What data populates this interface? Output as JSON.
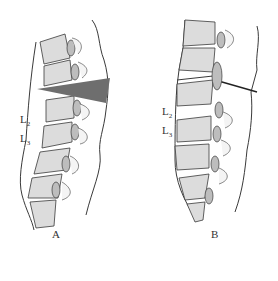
{
  "figure": {
    "panels": [
      {
        "id": "A",
        "caption": "A",
        "labels": [
          {
            "main": "L",
            "sub": "2"
          },
          {
            "main": "L",
            "sub": "3"
          }
        ],
        "wedge_color": "#6e6e6e"
      },
      {
        "id": "B",
        "caption": "B",
        "labels": [
          {
            "main": "L",
            "sub": "2"
          },
          {
            "main": "L",
            "sub": "3"
          }
        ]
      }
    ]
  },
  "colors": {
    "line": "#3a3a3a",
    "bone_fill": "#d8d8d8",
    "disc_fill": "#bdbdbd",
    "wedge": "#6e6e6e"
  }
}
